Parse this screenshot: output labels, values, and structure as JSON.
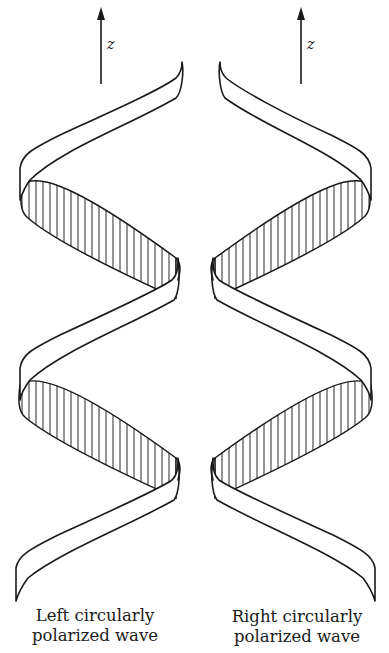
{
  "figure": {
    "axis_label": "z",
    "left_panel": {
      "caption_line1": "Left circularly",
      "caption_line2": "polarized wave",
      "handedness": "left"
    },
    "right_panel": {
      "caption_line1": "Right circularly",
      "caption_line2": "polarized wave",
      "handedness": "right"
    },
    "colors": {
      "ink": "#1a1a1a",
      "background": "#ffffff"
    }
  }
}
